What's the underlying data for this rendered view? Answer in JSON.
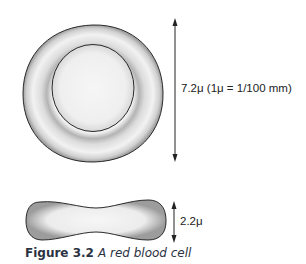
{
  "figure": {
    "number_label": "Figure 3.2",
    "title": "A red blood cell"
  },
  "top_view": {
    "diameter_label": "7.2μ (1μ = 1/100 mm)"
  },
  "side_view": {
    "thickness_label": "2.2μ"
  },
  "colors": {
    "cell_fill": "#f2f2f2",
    "cell_shadow": "#a8a8a8",
    "outline": "#2a2a2a",
    "caption_text": "#2b3242"
  }
}
